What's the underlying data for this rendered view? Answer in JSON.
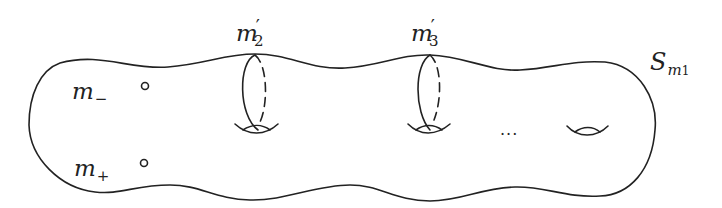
{
  "figure": {
    "stroke_color": "#222222",
    "background": "#ffffff"
  },
  "labels": {
    "surface": {
      "base": "S",
      "sub_base": "m",
      "sub_index": "1"
    },
    "curve_a": {
      "base": "m",
      "prime": "′",
      "sub": "2"
    },
    "curve_b": {
      "base": "m",
      "prime": "′",
      "sub": "3"
    },
    "point_minus": {
      "base": "m",
      "sub": "−"
    },
    "point_plus": {
      "base": "m",
      "sub": "+"
    },
    "ellipsis": "..."
  }
}
